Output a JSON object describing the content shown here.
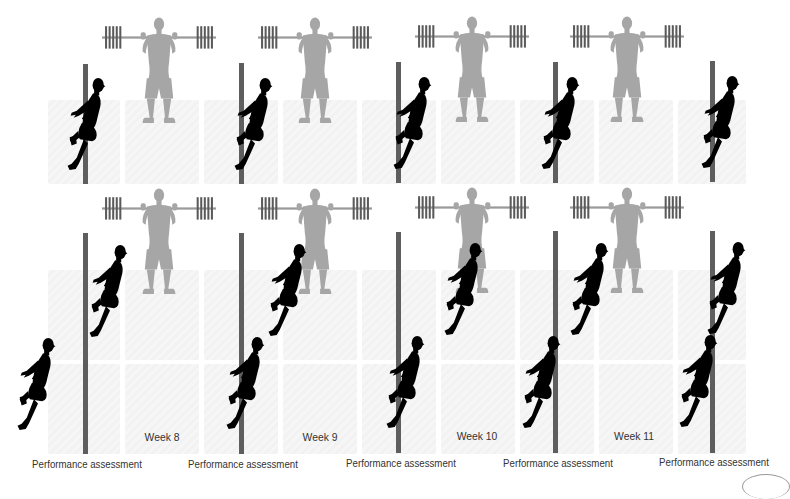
{
  "figure": {
    "weeks": [
      {
        "label": "Week 8"
      },
      {
        "label": "Week 9"
      },
      {
        "label": "Week 10"
      },
      {
        "label": "Week 11"
      }
    ],
    "assessments": [
      {
        "label": "Performance assessment"
      },
      {
        "label": "Performance assessment"
      },
      {
        "label": "Performance assessment"
      },
      {
        "label": "Performance assessment"
      },
      {
        "label": "Performance assessment"
      }
    ],
    "icons": {
      "runner": "sprinter-silhouette-icon",
      "lifter": "barbell-squat-lifter-icon",
      "pole": "timing-gate-pole-icon"
    },
    "colors": {
      "runner": "#000000",
      "lifter": "#a6a6a6",
      "barbell_plates": "#5a5a5a",
      "pole": "#5e5e5e",
      "tile": "#f4f4f4",
      "text": "#333333"
    }
  }
}
